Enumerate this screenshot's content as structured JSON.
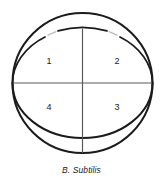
{
  "figure": {
    "caption": "B. Subtilis",
    "background_color": "#ffffff",
    "stroke_color": "#1b1b1b",
    "faded_stroke_color": "#9a9a9a",
    "divider_color": "#5a5a5a"
  },
  "plate": {
    "outer_circle": {
      "center_x": 82.5,
      "center_y": 83,
      "radius": 70,
      "stroke_width": 2
    },
    "inner_lens": {
      "center_x": 82.5,
      "center_y": 83,
      "radius_x": 70,
      "radius_y": 55,
      "stroke_width": 2
    },
    "divider_horizontal": {
      "x1": 13,
      "y1": 83,
      "x2": 152,
      "y2": 83
    },
    "divider_vertical": {
      "x1": 82.5,
      "y1": 28,
      "x2": 82.5,
      "y2": 153
    }
  },
  "quadrants": [
    {
      "id": "q1",
      "label": "1",
      "position": "upper-left"
    },
    {
      "id": "q2",
      "label": "2",
      "position": "upper-right"
    },
    {
      "id": "q3",
      "label": "3",
      "position": "lower-right"
    },
    {
      "id": "q4",
      "label": "4",
      "position": "lower-left"
    }
  ]
}
